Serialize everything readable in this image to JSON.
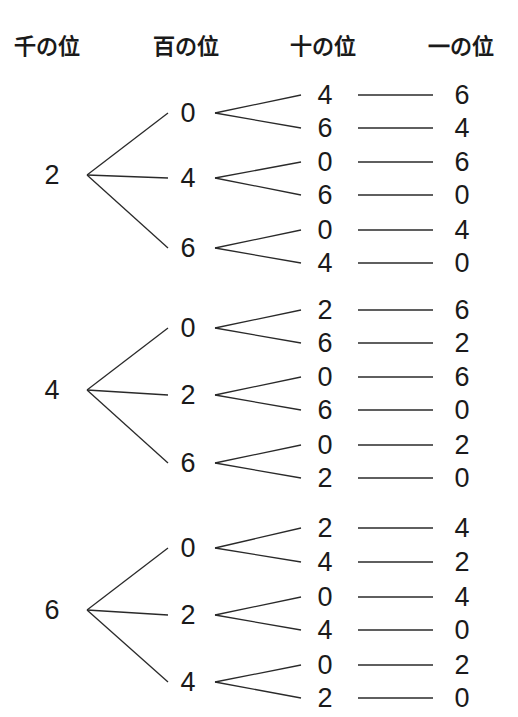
{
  "headers": [
    "千の位",
    "百の位",
    "十の位",
    "一の位"
  ],
  "tree": [
    {
      "thousands": "2",
      "hundreds": [
        {
          "digit": "0",
          "branches": [
            {
              "tens": "4",
              "ones": "6"
            },
            {
              "tens": "6",
              "ones": "4"
            }
          ]
        },
        {
          "digit": "4",
          "branches": [
            {
              "tens": "0",
              "ones": "6"
            },
            {
              "tens": "6",
              "ones": "0"
            }
          ]
        },
        {
          "digit": "6",
          "branches": [
            {
              "tens": "0",
              "ones": "4"
            },
            {
              "tens": "4",
              "ones": "0"
            }
          ]
        }
      ]
    },
    {
      "thousands": "4",
      "hundreds": [
        {
          "digit": "0",
          "branches": [
            {
              "tens": "2",
              "ones": "6"
            },
            {
              "tens": "6",
              "ones": "2"
            }
          ]
        },
        {
          "digit": "2",
          "branches": [
            {
              "tens": "0",
              "ones": "6"
            },
            {
              "tens": "6",
              "ones": "0"
            }
          ]
        },
        {
          "digit": "6",
          "branches": [
            {
              "tens": "0",
              "ones": "2"
            },
            {
              "tens": "2",
              "ones": "0"
            }
          ]
        }
      ]
    },
    {
      "thousands": "6",
      "hundreds": [
        {
          "digit": "0",
          "branches": [
            {
              "tens": "2",
              "ones": "4"
            },
            {
              "tens": "4",
              "ones": "2"
            }
          ]
        },
        {
          "digit": "2",
          "branches": [
            {
              "tens": "0",
              "ones": "4"
            },
            {
              "tens": "4",
              "ones": "0"
            }
          ]
        },
        {
          "digit": "4",
          "branches": [
            {
              "tens": "0",
              "ones": "2"
            },
            {
              "tens": "2",
              "ones": "0"
            }
          ]
        }
      ]
    }
  ]
}
